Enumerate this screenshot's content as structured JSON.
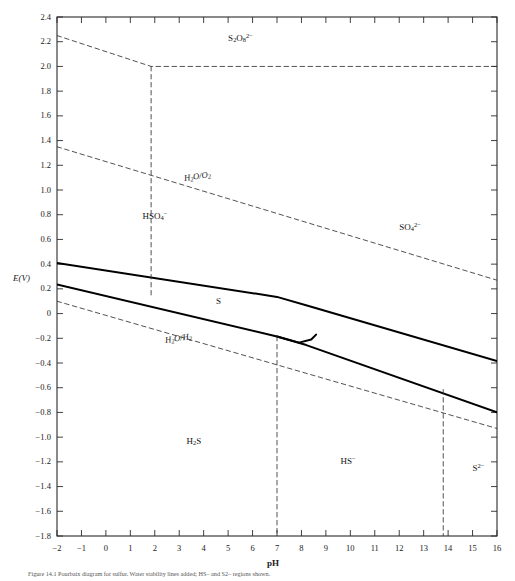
{
  "figure": {
    "caption": "Figure 14.1   Pourbaix diagram for sulfur. Water stability lines added; HS– and S2– regions shown.",
    "xlabel": "pH",
    "ylabel": "E(V)"
  },
  "chart_data": {
    "type": "line",
    "xlabel": "pH",
    "ylabel": "E(V)",
    "xlim": [
      -2,
      16
    ],
    "ylim": [
      -1.8,
      2.4
    ],
    "grid": false,
    "legend": "none",
    "xticks": [
      -2,
      -1,
      0,
      1,
      2,
      3,
      4,
      5,
      6,
      7,
      8,
      9,
      10,
      11,
      12,
      13,
      14,
      15,
      16
    ],
    "xticklabels": [
      "−2",
      "−1",
      "0",
      "1",
      "2",
      "3",
      "4",
      "5",
      "6",
      "7",
      "8",
      "9",
      "10",
      "11",
      "12",
      "13",
      "14",
      "15",
      "16"
    ],
    "yticks": [
      -1.8,
      -1.6,
      -1.4,
      -1.2,
      -1.0,
      -0.8,
      -0.6,
      -0.4,
      -0.2,
      0,
      0.2,
      0.4,
      0.6,
      0.8,
      1.0,
      1.2,
      1.4,
      1.6,
      1.8,
      2.0,
      2.2,
      2.4
    ],
    "yticklabels": [
      "−1.8",
      "−1.6",
      "−1.4",
      "−1.2",
      "−1.0",
      "−0.8",
      "−0.6",
      "−0.4",
      "−0.2",
      "0",
      "0.2",
      "0.4",
      "0.6",
      "0.8",
      "1.0",
      "1.2",
      "1.4",
      "1.6",
      "1.8",
      "2.0",
      "2.2",
      "2.4"
    ],
    "series": [
      {
        "name": "S2O8(2-)/HSO4- boundary",
        "style": "dashed",
        "color": "#333333",
        "points": [
          [
            -2,
            2.25
          ],
          [
            1.85,
            2.0
          ],
          [
            16,
            2.0
          ]
        ]
      },
      {
        "name": "H2O/O2 line",
        "style": "dashed",
        "color": "#333333",
        "points": [
          [
            -2,
            1.35
          ],
          [
            16,
            0.27
          ]
        ]
      },
      {
        "name": "H2O/H2 line",
        "style": "dashed",
        "color": "#333333",
        "points": [
          [
            -2,
            0.1
          ],
          [
            16,
            -0.93
          ]
        ]
      },
      {
        "name": "HSO4-/SO4(2-) upper S boundary",
        "style": "solid",
        "color": "#000000",
        "points": [
          [
            -2,
            0.41
          ],
          [
            7.0,
            0.135
          ],
          [
            8.4,
            0.055
          ],
          [
            16,
            -0.385
          ]
        ]
      },
      {
        "name": "S/H2S lower boundary",
        "style": "solid",
        "color": "#000000",
        "points": [
          [
            -2,
            0.235
          ],
          [
            7.0,
            -0.185
          ],
          [
            8.2,
            -0.255
          ],
          [
            16,
            -0.8
          ]
        ]
      },
      {
        "name": "S region closure arc",
        "style": "solid",
        "color": "#000000",
        "points": [
          [
            7.0,
            -0.185
          ],
          [
            7.9,
            -0.235
          ],
          [
            8.4,
            -0.21
          ],
          [
            8.6,
            -0.17
          ]
        ]
      },
      {
        "name": "pH 1.85 vertical boundary",
        "style": "dashed",
        "color": "#333333",
        "points": [
          [
            1.85,
            2.0
          ],
          [
            1.85,
            0.13
          ]
        ]
      },
      {
        "name": "pH 7 vertical boundary",
        "style": "dashed",
        "color": "#333333",
        "points": [
          [
            7.0,
            -0.185
          ],
          [
            7.0,
            -1.8
          ]
        ]
      },
      {
        "name": "pH 13.8 vertical boundary",
        "style": "dashed",
        "color": "#333333",
        "points": [
          [
            13.8,
            -0.615
          ],
          [
            13.8,
            -1.8
          ]
        ]
      }
    ],
    "region_labels": [
      {
        "text": "S₂O₈²⁻",
        "html": "S<sub>2</sub>O<sub>8</sub><sup>2−</sup>",
        "x": 5.0,
        "y": 2.23
      },
      {
        "text": "HSO₄⁻",
        "html": "HSO<sub>4</sub><sup>−</sup>",
        "x": 1.5,
        "y": 0.79
      },
      {
        "text": "SO₄²⁻",
        "html": "SO<sub>4</sub><sup>2−</sup>",
        "x": 12.0,
        "y": 0.7
      },
      {
        "text": "S",
        "html": "S",
        "x": 4.5,
        "y": 0.09
      },
      {
        "text": "H₂S",
        "html": "H<sub>2</sub>S",
        "x": 3.3,
        "y": -1.04
      },
      {
        "text": "HS⁻",
        "html": "HS<sup>−</sup>",
        "x": 9.6,
        "y": -1.19
      },
      {
        "text": "S²⁻",
        "html": "S<sup>2−</sup>",
        "x": 15.0,
        "y": -1.25
      }
    ],
    "line_labels": [
      {
        "text": "H₂O/O₂",
        "html": "H<sub>2</sub>O/O<sub>2</sub>",
        "x": 3.2,
        "y": 1.09,
        "rotation": -8.5
      },
      {
        "text": "H₂O/H₂",
        "html": "H<sub>2</sub>O/H<sub>2</sub>",
        "x": 2.4,
        "y": -0.22,
        "rotation": -8.5
      }
    ]
  }
}
